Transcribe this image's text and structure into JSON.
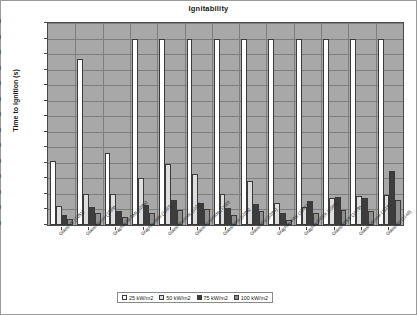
{
  "chart_data": {
    "type": "bar",
    "title": "Ignitability",
    "xlabel": "",
    "ylabel": "Time to ignition (s)",
    "ylim": [
      0,
      650
    ],
    "ytick_step": 50,
    "yticks": [
      0,
      50,
      100,
      150,
      200,
      250,
      300,
      350,
      400,
      450,
      500,
      550,
      600,
      650
    ],
    "grid": true,
    "legend_position": "bottom",
    "plot_background": "#a8a8a8",
    "categories": [
      "Glass/VE (1051)",
      "Glass/Epoxy (1089)",
      "Graphite/M BMI (1096)",
      "Graphite/BMI (1097)",
      "Glass/Phenolic (1100)",
      "Glass/Polyimide (1150)",
      "Glass/PPS (1095)",
      "Glass/PPS (1094)",
      "Graphite/PAS (1081)",
      "Graphite/PEEK (1086)",
      "Glass/PEKK (1079)",
      "Glass/Silicone (1116)",
      "Glass/PN (1148)"
    ],
    "series": [
      {
        "name": "25 kW/m2",
        "color": "#ffffff",
        "values": [
          205,
          535,
          232,
          600,
          600,
          600,
          600,
          600,
          600,
          600,
          600,
          600,
          600
        ]
      },
      {
        "name": "50 kW/m2",
        "color": "#dedede",
        "values": [
          60,
          101,
          100,
          151,
          195,
          165,
          100,
          143,
          72,
          58,
          88,
          92,
          95
        ]
      },
      {
        "name": "75 kW/m2",
        "color": "#3d3d3d",
        "values": [
          31,
          58,
          44,
          64,
          79,
          72,
          54,
          68,
          39,
          78,
          90,
          88,
          175
        ]
      },
      {
        "name": "100 kW/m2",
        "color": "#8f8f8f",
        "values": [
          20,
          39,
          25,
          38,
          48,
          50,
          31,
          46,
          16,
          40,
          49,
          45,
          81
        ]
      }
    ]
  }
}
